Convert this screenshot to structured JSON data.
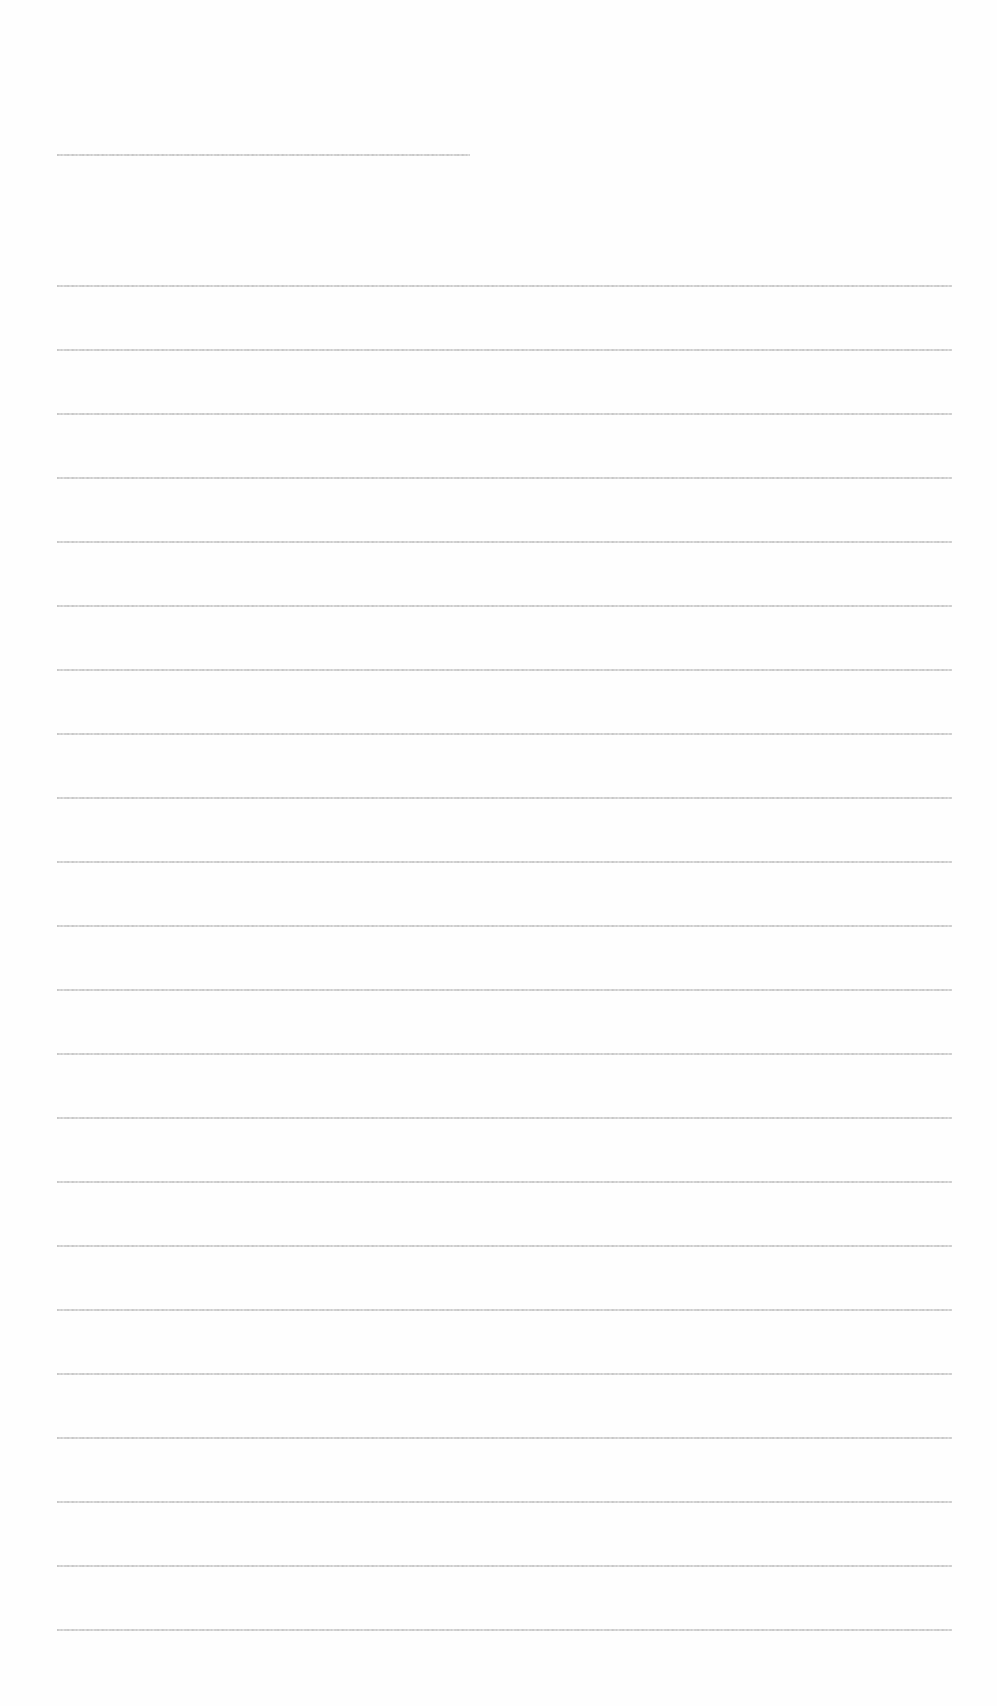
{
  "document": {
    "legibility": "illegible",
    "heading_line": {
      "text": ""
    },
    "body_lines": [
      {
        "text": ""
      },
      {
        "text": ""
      },
      {
        "text": ""
      },
      {
        "text": ""
      },
      {
        "text": ""
      },
      {
        "text": ""
      },
      {
        "text": ""
      },
      {
        "text": ""
      },
      {
        "text": ""
      },
      {
        "text": ""
      },
      {
        "text": ""
      },
      {
        "text": ""
      },
      {
        "text": ""
      },
      {
        "text": ""
      },
      {
        "text": ""
      },
      {
        "text": ""
      },
      {
        "text": ""
      },
      {
        "text": ""
      },
      {
        "text": ""
      },
      {
        "text": ""
      },
      {
        "text": ""
      },
      {
        "text": ""
      }
    ]
  },
  "layout": {
    "heading_top": 154,
    "heading_width": 413,
    "body_first_top": 285,
    "body_line_spacing": 64,
    "body_width": 895,
    "text_color": "#c4c4c4",
    "page_color": "#fefefe"
  }
}
